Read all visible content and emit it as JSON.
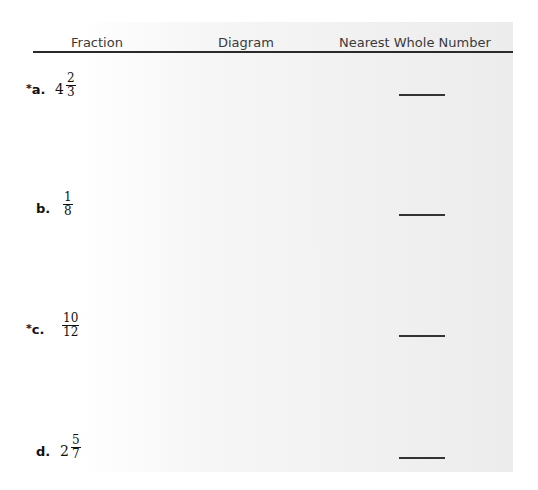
{
  "table": {
    "headers": {
      "fraction": "Fraction",
      "diagram": "Diagram",
      "nearest": "Nearest Whole Number"
    },
    "rows": [
      {
        "starred": true,
        "letter": "a.",
        "whole": "4",
        "numerator": "2",
        "denominator": "3",
        "answer": ""
      },
      {
        "starred": false,
        "letter": "b.",
        "whole": "",
        "numerator": "1",
        "denominator": "8",
        "answer": ""
      },
      {
        "starred": true,
        "letter": "c.",
        "whole": "",
        "numerator": "10",
        "denominator": "12",
        "answer": ""
      },
      {
        "starred": false,
        "letter": "d.",
        "whole": "2",
        "numerator": "5",
        "denominator": "7",
        "answer": ""
      }
    ],
    "star_symbol": "*"
  }
}
